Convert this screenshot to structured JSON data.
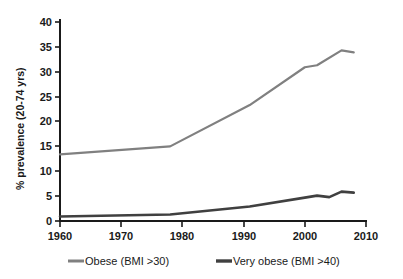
{
  "chart_data": {
    "type": "line",
    "title": "",
    "subtitle": "",
    "xlabel": "",
    "ylabel": "% prevalence (20-74 yrs)",
    "xlim": [
      1960,
      2010
    ],
    "ylim": [
      0,
      40
    ],
    "xticks": [
      1960,
      1970,
      1980,
      1990,
      2000,
      2010
    ],
    "yticks": [
      0,
      5,
      10,
      15,
      20,
      25,
      30,
      35,
      40
    ],
    "grid": false,
    "legend_position": "bottom",
    "series": [
      {
        "name": "Obese (BMI >30)",
        "color": "#808080",
        "x": [
          1960,
          1978,
          1991,
          2000,
          2002,
          2006,
          2008
        ],
        "values": [
          13.4,
          15.0,
          23.3,
          30.9,
          31.3,
          34.3,
          33.9
        ]
      },
      {
        "name": "Very obese (BMI >40)",
        "color": "#404040",
        "x": [
          1960,
          1978,
          1991,
          2000,
          2002,
          2004,
          2006,
          2008
        ],
        "values": [
          0.9,
          1.3,
          2.9,
          4.7,
          5.1,
          4.8,
          5.9,
          5.7
        ]
      }
    ]
  },
  "axis": {
    "y_label": "% prevalence (20-74 yrs)",
    "y_tick_0": "0",
    "y_tick_5": "5",
    "y_tick_10": "10",
    "y_tick_15": "15",
    "y_tick_20": "20",
    "y_tick_25": "25",
    "y_tick_30": "30",
    "y_tick_35": "35",
    "y_tick_40": "40",
    "x_tick_1960": "1960",
    "x_tick_1970": "1970",
    "x_tick_1980": "1980",
    "x_tick_1990": "1990",
    "x_tick_2000": "2000",
    "x_tick_2010": "2010"
  },
  "legend": {
    "items": [
      {
        "label": "Obese (BMI >30)",
        "color": "#808080"
      },
      {
        "label": "Very obese (BMI >40)",
        "color": "#404040"
      }
    ]
  }
}
